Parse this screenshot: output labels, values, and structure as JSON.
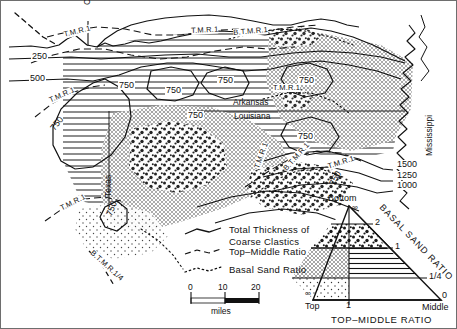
{
  "figure": {
    "type": "geologic-isopach-facies-map",
    "region": "East Texas - North Louisiana - South Arkansas"
  },
  "map": {
    "state_labels": [
      {
        "name": "okla-label",
        "text": "Okla.",
        "x": 86,
        "y": 8,
        "rotate": -90
      },
      {
        "name": "arkansas-label",
        "text": "Arkansas",
        "x": 232,
        "y": 101,
        "rotate": 0
      },
      {
        "name": "louisiana-label",
        "text": "Louisiana",
        "x": 235,
        "y": 115,
        "rotate": 0
      },
      {
        "name": "texas-label",
        "text": "Texas",
        "x": 108,
        "y": 168,
        "rotate": -90
      },
      {
        "name": "mississippi-label",
        "text": "Mississippi",
        "x": 428,
        "y": 100,
        "rotate": -90
      }
    ],
    "thickness_contour_labels": [
      {
        "text": "250",
        "x": 40,
        "y": 57
      },
      {
        "text": "500",
        "x": 38,
        "y": 79
      },
      {
        "text": "750",
        "x": 120,
        "y": 86
      },
      {
        "text": "750",
        "x": 170,
        "y": 92
      },
      {
        "text": "750",
        "x": 205,
        "y": 81
      },
      {
        "text": "750",
        "x": 302,
        "y": 82
      },
      {
        "text": "750",
        "x": 308,
        "y": 137
      },
      {
        "text": "750",
        "x": 320,
        "y": 107
      },
      {
        "text": "750",
        "x": 58,
        "y": 131,
        "rotate": -52
      },
      {
        "text": "750",
        "x": 108,
        "y": 219,
        "rotate": -68
      },
      {
        "text": "750",
        "x": 332,
        "y": 188,
        "rotate": -62
      },
      {
        "text": "1000",
        "x": 394,
        "y": 185
      },
      {
        "text": "1250",
        "x": 394,
        "y": 175
      },
      {
        "text": "1500",
        "x": 394,
        "y": 164
      }
    ],
    "ratio_contour_labels": [
      {
        "text": "T.M.R.1",
        "x": 66,
        "y": 33,
        "rotate": -14
      },
      {
        "text": "T.M.R.1",
        "x": 196,
        "y": 28,
        "rotate": -3
      },
      {
        "text": "T.M.R.1",
        "x": 278,
        "y": 87,
        "rotate": 0
      },
      {
        "text": "T.M.R.1",
        "x": 51,
        "y": 100,
        "rotate": -24
      },
      {
        "text": "T.M.R.1",
        "x": 62,
        "y": 208,
        "rotate": -26
      },
      {
        "text": "T.M.R.1",
        "x": 253,
        "y": 170,
        "rotate": -70
      },
      {
        "text": "T.M.R.1",
        "x": 330,
        "y": 165,
        "rotate": -18
      },
      {
        "text": "B.T.M.R.1",
        "x": 239,
        "y": 30,
        "rotate": -5
      },
      {
        "text": "B.T.M.R.1",
        "x": 285,
        "y": 170,
        "rotate": -48
      },
      {
        "text": "B.T.M.R.1/4",
        "x": 96,
        "y": 252,
        "rotate": 42
      }
    ]
  },
  "legend": {
    "entries": [
      {
        "name": "total-thickness",
        "line_style": "solid",
        "label_line1": "Total Thickness of",
        "label_line2": "Coarse Clastics"
      },
      {
        "name": "top-middle-ratio",
        "line_style": "dashed",
        "label_line1": "Top–Middle Ratio",
        "label_line2": ""
      },
      {
        "name": "basal-sand-ratio",
        "line_style": "dotted",
        "label_line1": "Basal Sand Ratio",
        "label_line2": ""
      }
    ]
  },
  "scale_bar": {
    "ticks": [
      "0",
      "10",
      "20"
    ],
    "units": "miles"
  },
  "ternary": {
    "apex_label": "Bottom",
    "apex_value": "∞",
    "left_label": "Top",
    "left_value": "∞",
    "right_label": "Middle",
    "right_value": "0",
    "bottom_mid_value": "1",
    "right_axis_title": "BASAL SAND RATIO",
    "bottom_axis_title": "TOP–MIDDLE RATIO",
    "right_axis_ticks": [
      "2",
      "1",
      "1/4",
      "0"
    ]
  },
  "colors": {
    "ink": "#111111",
    "line": "#1a1a1a",
    "paper": "#ffffff",
    "frame": "#6e6e6e"
  }
}
